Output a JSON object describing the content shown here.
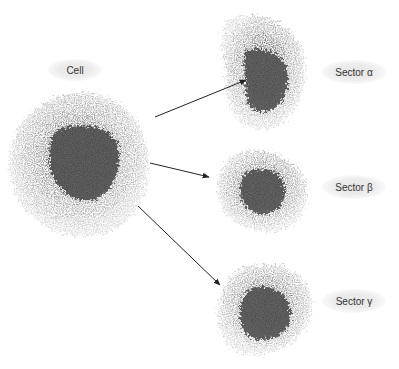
{
  "diagram": {
    "type": "cell-sectoring",
    "source": {
      "label": "Cell",
      "center": [
        78,
        163
      ],
      "radius": 70
    },
    "targets": [
      {
        "label": "Sector α",
        "center": [
          262,
          73
        ]
      },
      {
        "label": "Sector β",
        "center": [
          262,
          188
        ]
      },
      {
        "label": "Sector γ",
        "center": [
          262,
          303
        ]
      }
    ],
    "arrows": [
      {
        "from": [
          155,
          117
        ],
        "to": [
          246,
          80
        ],
        "target": "Sector α"
      },
      {
        "from": [
          150,
          163
        ],
        "to": [
          209,
          177
        ],
        "target": "Sector β"
      },
      {
        "from": [
          138,
          206
        ],
        "to": [
          220,
          285
        ],
        "target": "Sector γ"
      }
    ],
    "colors": {
      "outer": "#9a9a9a",
      "inner": "#4a4a4a",
      "arrow": "#222222",
      "label_bg": "#e8e8e8",
      "label_text": "#333333"
    }
  }
}
